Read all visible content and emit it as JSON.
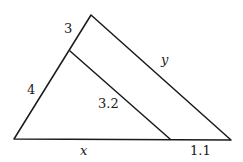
{
  "diagram": {
    "type": "similar-triangles",
    "labels": {
      "upper_left_segment": "3",
      "lower_left_segment": "4",
      "hypotenuse": "y",
      "inner_parallel": "3.2",
      "base_left": "x",
      "base_right": "1.1"
    },
    "colors": {
      "line": "#1a1a1a",
      "background": "#ffffff"
    }
  }
}
